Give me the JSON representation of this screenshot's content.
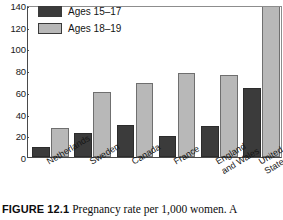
{
  "chart_data": {
    "type": "bar",
    "title": "",
    "xlabel": "",
    "ylabel": "",
    "ylim": [
      0,
      140
    ],
    "yticks": [
      140,
      120,
      100,
      80,
      60,
      40,
      20,
      0
    ],
    "grid": false,
    "legend_position": "top-left",
    "categories": [
      "Netherlands",
      "Sweden",
      "Canada",
      "France",
      "England and Wales",
      "United States"
    ],
    "category_lines": [
      [
        "Netherlands"
      ],
      [
        "Sweden"
      ],
      [
        "Canada"
      ],
      [
        "France"
      ],
      [
        "England",
        "and Wales"
      ],
      [
        "United",
        "States"
      ]
    ],
    "series": [
      {
        "name": "Ages 15–17",
        "color": "#3b3b3b",
        "values": [
          9,
          22,
          30,
          20,
          29,
          64
        ]
      },
      {
        "name": "Ages 18–19",
        "color": "#b8b8b8",
        "values": [
          27,
          60,
          69,
          78,
          76,
          145
        ]
      }
    ]
  },
  "legend": {
    "items": [
      {
        "label": "Ages 15–17",
        "color": "#3b3b3b"
      },
      {
        "label": "Ages 18–19",
        "color": "#b8b8b8"
      }
    ]
  },
  "yaxis": {
    "ticks": [
      "140",
      "120",
      "100",
      "80",
      "60",
      "40",
      "20",
      "0"
    ]
  },
  "caption": {
    "figure_number": "FIGURE 12.1",
    "text": "Pregnancy rate per 1,000 women. A"
  }
}
